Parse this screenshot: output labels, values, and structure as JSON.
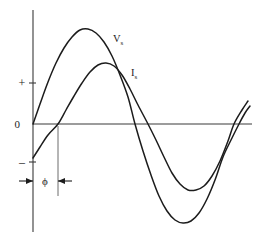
{
  "figure": {
    "background_color": "#ffffff",
    "curve_color": "#1c1c1c",
    "axis_color": "#3a3a3a",
    "marker_color": "#6d6d6d"
  },
  "axes": {
    "vertical_axis_name": "amplitude-axis",
    "horizontal_axis_name": "time-axis",
    "origin_label": "0",
    "positive_label": "+",
    "negative_label": "–",
    "origin_x": 33,
    "origin_y": 124,
    "vertical_top_y": 10,
    "vertical_bottom_y": 232,
    "horizontal_right_x": 252
  },
  "labels": {
    "voltage": {
      "symbol": "V",
      "subscript": "s",
      "full": "Vs",
      "x": 115,
      "y": 40
    },
    "current": {
      "symbol": "I",
      "subscript": "s",
      "full": "Is",
      "x": 132,
      "y": 74
    },
    "phase": {
      "symbol": "ϕ",
      "full": "ϕ",
      "x": 45,
      "y": 183
    },
    "origin": {
      "text": "0",
      "x": 23,
      "y": 128
    },
    "positive": {
      "text": "+",
      "x": 23,
      "y": 86
    },
    "negative": {
      "text": "–",
      "x": 23,
      "y": 165
    }
  },
  "phase_annotation": {
    "name": "phase-angle-dimension",
    "start_x": 33,
    "end_x": 58,
    "y": 181,
    "guide_top_y": 126,
    "guide_bottom_y": 196,
    "description": "Current lags voltage by phase angle phi"
  },
  "chart_data": {
    "type": "line",
    "xlabel": "",
    "ylabel": "",
    "grid": false,
    "legend": "inline-curve-labels",
    "xlim": [
      0,
      1.12
    ],
    "ylim": [
      -1.05,
      1.05
    ],
    "x_axis_note": "time / angle (one full cycle plus a small overshoot)",
    "y_axis_note": "amplitude (relative); 0 marks the zero crossing axis",
    "series": [
      {
        "name": "Vs",
        "label": "V_s",
        "description": "Source voltage sinusoid starting at the origin (zero phase)",
        "amplitude": 1.0,
        "phase_offset_cycles": 0.0,
        "peak": {
          "x_px": 85,
          "y_px": 29,
          "value": 1.0
        },
        "trough": {
          "x_px": 186,
          "y_px": 222,
          "value": -1.0
        },
        "zero_crossings_px": [
          33,
          135,
          239
        ],
        "points_px": [
          [
            33,
            124
          ],
          [
            40,
            104
          ],
          [
            48,
            82
          ],
          [
            56,
            63
          ],
          [
            64,
            48
          ],
          [
            72,
            37
          ],
          [
            80,
            30
          ],
          [
            88,
            29
          ],
          [
            96,
            33
          ],
          [
            104,
            42
          ],
          [
            112,
            56
          ],
          [
            120,
            75
          ],
          [
            128,
            97
          ],
          [
            135,
            124
          ],
          [
            143,
            151
          ],
          [
            151,
            175
          ],
          [
            159,
            196
          ],
          [
            167,
            211
          ],
          [
            175,
            220
          ],
          [
            183,
            223
          ],
          [
            191,
            221
          ],
          [
            199,
            213
          ],
          [
            207,
            199
          ],
          [
            215,
            180
          ],
          [
            223,
            157
          ],
          [
            231,
            140
          ],
          [
            239,
            124
          ],
          [
            245,
            113
          ],
          [
            250,
            106
          ]
        ]
      },
      {
        "name": "Is",
        "label": "I_s",
        "description": "Source current sinusoid lagging the voltage by angle phi",
        "amplitude": 0.72,
        "phase_offset_cycles": 0.075,
        "peak": {
          "x_px": 100,
          "y_px": 63,
          "value": 0.72
        },
        "trough": {
          "x_px": 190,
          "y_px": 190,
          "value": -0.72
        },
        "zero_crossings_px": [
          58,
          148,
          234
        ],
        "points_px": [
          [
            33,
            158
          ],
          [
            40,
            147
          ],
          [
            48,
            135
          ],
          [
            58,
            124
          ],
          [
            66,
            110
          ],
          [
            74,
            96
          ],
          [
            82,
            83
          ],
          [
            90,
            72
          ],
          [
            98,
            65
          ],
          [
            106,
            63
          ],
          [
            114,
            66
          ],
          [
            122,
            75
          ],
          [
            130,
            89
          ],
          [
            138,
            105
          ],
          [
            148,
            124
          ],
          [
            156,
            140
          ],
          [
            164,
            157
          ],
          [
            172,
            173
          ],
          [
            180,
            184
          ],
          [
            188,
            190
          ],
          [
            196,
            190
          ],
          [
            204,
            186
          ],
          [
            212,
            176
          ],
          [
            220,
            161
          ],
          [
            228,
            141
          ],
          [
            234,
            124
          ],
          [
            242,
            110
          ],
          [
            248,
            101
          ]
        ]
      }
    ],
    "annotations": [
      {
        "name": "phase-angle",
        "text": "ϕ",
        "type": "dimension",
        "between": [
          "Vs zero crossing",
          "Is zero crossing"
        ],
        "meaning": "phase difference between source voltage and source current"
      },
      {
        "name": "zero-level",
        "text": "0",
        "type": "axis-label"
      },
      {
        "name": "positive-half",
        "text": "+",
        "type": "axis-label"
      },
      {
        "name": "negative-half",
        "text": "–",
        "type": "axis-label"
      }
    ]
  }
}
